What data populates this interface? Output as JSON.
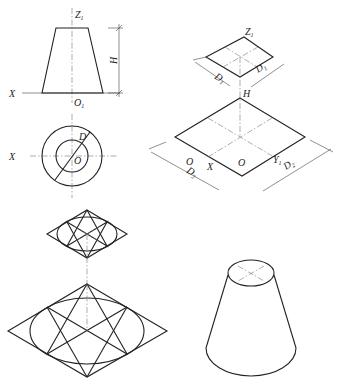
{
  "figure": {
    "front_view": {
      "labels": {
        "z_axis": "Z",
        "z_sub": "1",
        "x_axis": "X",
        "origin": "O",
        "origin_sub": "1",
        "height": "H"
      }
    },
    "top_view": {
      "labels": {
        "x_axis": "X",
        "diameter": "D",
        "center": "O"
      }
    },
    "iso_construction": {
      "labels": {
        "z_axis": "Z",
        "z_sub": "1",
        "d1_left": "D",
        "d1_left_sub": "1",
        "d1_right": "D",
        "d1_right_sub": "1",
        "height": "H",
        "center": "O",
        "x_axis": "X",
        "y_axis": "Y",
        "y_sub": "1",
        "d2_left": "D",
        "d2_left_sub": "2",
        "d2_right": "D",
        "d2_right_sub": "2"
      }
    },
    "ellipse_construction": {
      "description": "Four-center approximate ellipses inside rhombi"
    },
    "result": {
      "description": "Finished isometric frustum"
    }
  }
}
